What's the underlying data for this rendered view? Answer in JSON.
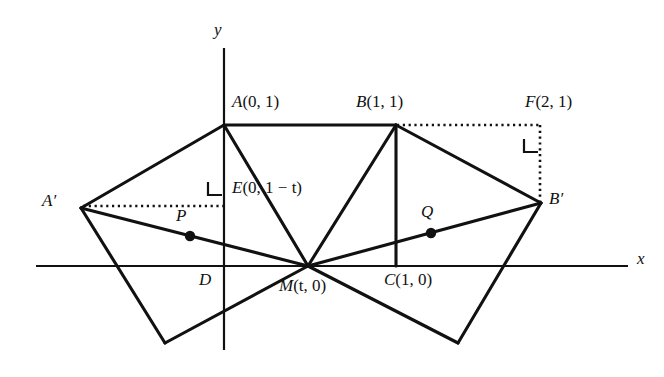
{
  "figure": {
    "background_color": "#ffffff",
    "stroke_color": "#111111",
    "width": 664,
    "height": 377
  },
  "axes": {
    "x_label": "x",
    "y_label": "y",
    "x_axis": {
      "x1": 36,
      "y1": 266,
      "x2": 628,
      "y2": 266
    },
    "y_axis": {
      "x1": 224,
      "y1": 48,
      "x2": 224,
      "y2": 350
    },
    "x_label_pos": {
      "x": 637,
      "y": 253
    },
    "y_label_pos": {
      "x": 213,
      "y": 22
    }
  },
  "points": [
    {
      "name": "A",
      "label": "A",
      "coords": "(0, 1)",
      "x": 224,
      "y": 125,
      "label_x": 232,
      "label_y": 95,
      "dot": false
    },
    {
      "name": "B",
      "label": "B",
      "coords": "(1, 1)",
      "x": 396,
      "y": 125,
      "label_x": 358,
      "label_y": 95,
      "dot": false
    },
    {
      "name": "F",
      "label": "F",
      "coords": "(2, 1)",
      "x": 540,
      "y": 126,
      "label_x": 527,
      "label_y": 95,
      "dot": false
    },
    {
      "name": "E",
      "label": "E",
      "coords": "(0, 1 − t)",
      "x": 224,
      "y": 205,
      "label_x": 232,
      "label_y": 179,
      "dot": false
    },
    {
      "name": "A-prime",
      "label": "A′",
      "coords": "",
      "x": 81,
      "y": 208,
      "label_x": 42,
      "label_y": 192,
      "dot": false
    },
    {
      "name": "B-prime",
      "label": "B′",
      "coords": "",
      "x": 541,
      "y": 203,
      "label_x": 549,
      "label_y": 190,
      "dot": false
    },
    {
      "name": "M",
      "label": "M",
      "coords": "(t, 0)",
      "x": 308,
      "y": 266,
      "label_x": 280,
      "label_y": 278,
      "dot": false
    },
    {
      "name": "D",
      "label": "D",
      "coords": "",
      "x": 224,
      "y": 266,
      "label_x": 199,
      "label_y": 272,
      "dot": false
    },
    {
      "name": "C",
      "label": "C",
      "coords": "(1, 0)",
      "x": 396,
      "y": 266,
      "label_x": 386,
      "label_y": 272,
      "dot": false
    },
    {
      "name": "P",
      "label": "P",
      "coords": "",
      "x": 190,
      "y": 236,
      "label_x": 176,
      "label_y": 208,
      "dot": true
    },
    {
      "name": "Q",
      "label": "Q",
      "coords": "",
      "x": 431,
      "y": 233,
      "label_x": 421,
      "label_y": 203,
      "dot": true
    }
  ],
  "solid_segments": [
    {
      "name": "segment-A-to-A-prime",
      "x1": 224,
      "y1": 125,
      "x2": 81,
      "y2": 208
    },
    {
      "name": "segment-A-to-B",
      "x1": 224,
      "y1": 125,
      "x2": 396,
      "y2": 125
    },
    {
      "name": "segment-A-to-M",
      "x1": 224,
      "y1": 125,
      "x2": 308,
      "y2": 266
    },
    {
      "name": "segment-A-prime-to-M",
      "x1": 81,
      "y1": 208,
      "x2": 308,
      "y2": 266
    },
    {
      "name": "segment-A-prime-to-bottomL",
      "x1": 81,
      "y1": 208,
      "x2": 165,
      "y2": 343
    },
    {
      "name": "segment-bottomL-to-M",
      "x1": 165,
      "y1": 343,
      "x2": 308,
      "y2": 266
    },
    {
      "name": "segment-B-to-M",
      "x1": 396,
      "y1": 125,
      "x2": 308,
      "y2": 266
    },
    {
      "name": "segment-B-to-C",
      "x1": 396,
      "y1": 125,
      "x2": 396,
      "y2": 266
    },
    {
      "name": "segment-B-to-B-prime",
      "x1": 396,
      "y1": 125,
      "x2": 541,
      "y2": 203
    },
    {
      "name": "segment-B-prime-to-M",
      "x1": 541,
      "y1": 203,
      "x2": 308,
      "y2": 266
    },
    {
      "name": "segment-B-prime-to-bottomR",
      "x1": 541,
      "y1": 203,
      "x2": 458,
      "y2": 343
    },
    {
      "name": "segment-bottomR-to-M",
      "x1": 458,
      "y1": 343,
      "x2": 308,
      "y2": 266
    }
  ],
  "dotted_segments": [
    {
      "name": "dotted-A-prime-to-E",
      "x1": 83,
      "y1": 206,
      "x2": 224,
      "y2": 206
    },
    {
      "name": "dotted-B-to-F",
      "x1": 397,
      "y1": 125,
      "x2": 541,
      "y2": 125
    },
    {
      "name": "dotted-F-to-B-prime",
      "x1": 540,
      "y1": 125,
      "x2": 540,
      "y2": 203
    }
  ],
  "right_angle_marks": [
    {
      "name": "right-angle-at-E",
      "path": "M 208 182 L 208 195 L 222 195"
    },
    {
      "name": "right-angle-at-F",
      "path": "M 524 139 L 524 152 L 538 152"
    }
  ],
  "notes": {
    "shape": "Unit square ABCD with A(0,1), B(1,1), C(1,0), D(0,0) partly shown; image quadrilateral A'MB' reflected/rotated about M(t,0).",
    "marked_points": [
      "P",
      "Q"
    ]
  }
}
